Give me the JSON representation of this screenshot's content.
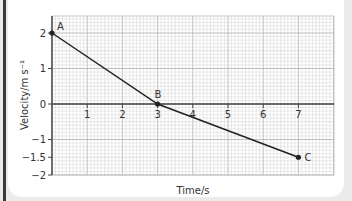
{
  "chart_data": {
    "type": "line",
    "title": "",
    "xlabel": "Time/s",
    "ylabel": "Velocity/m s⁻¹",
    "xlim": [
      0,
      8
    ],
    "ylim": [
      -2,
      2.5
    ],
    "x_ticks": [
      1,
      2,
      3,
      4,
      5,
      6,
      7
    ],
    "y_ticks": [
      2,
      1,
      0,
      -1,
      -1.5,
      -2
    ],
    "x_tick_labels": [
      "1",
      "2",
      "3",
      "4",
      "5",
      "6",
      "7"
    ],
    "y_tick_labels": [
      "2",
      "1",
      "0",
      "−1",
      "−1.5",
      "−2"
    ],
    "grid": true,
    "legend": "none",
    "series": [
      {
        "name": "velocity",
        "x": [
          0,
          3,
          7
        ],
        "y": [
          2,
          0,
          -1.5
        ],
        "point_labels": [
          "A",
          "B",
          "C"
        ]
      }
    ],
    "colors": {
      "line": "#222222",
      "grid_minor": "#d4d4d4",
      "grid_major": "#b8b8b8",
      "axis": "#444444"
    }
  }
}
